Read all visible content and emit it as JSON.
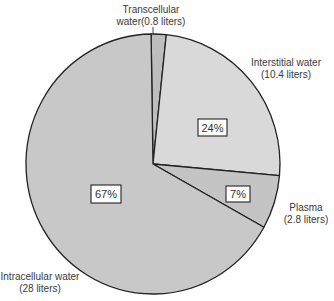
{
  "chart_data": {
    "type": "pie",
    "title": "",
    "slices": [
      {
        "name": "Transcellular water",
        "label_line1": "Transcellular",
        "label_line2": "water(0.8 liters)",
        "liters": 0.8,
        "percent": 2,
        "percent_label": "",
        "color": "#bdbdbd"
      },
      {
        "name": "Interstitial water",
        "label_line1": "Interstitial water",
        "label_line2": "(10.4 liters)",
        "liters": 10.4,
        "percent": 24,
        "percent_label": "24%",
        "color": "#d9d9d9"
      },
      {
        "name": "Plasma",
        "label_line1": "Plasma",
        "label_line2": "(2.8 liters)",
        "liters": 2.8,
        "percent": 7,
        "percent_label": "7%",
        "color": "#c4c4c4"
      },
      {
        "name": "Intracellular water",
        "label_line1": "Intracellular water",
        "label_line2": "(28 liters)",
        "liters": 28,
        "percent": 67,
        "percent_label": "67%",
        "color": "#c8c8c8"
      }
    ],
    "legend": "none"
  }
}
